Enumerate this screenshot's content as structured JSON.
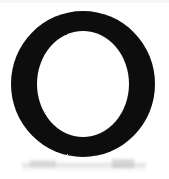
{
  "image": {
    "kind": "scanned-letterform",
    "character": "O",
    "description": "Uppercase letter O rendered as a solid black oval ring on a white background",
    "width": 169,
    "height": 179,
    "background_color": "#ffffff",
    "ink_color": "#0a0a0a",
    "smudge_color": "#c4c4c6"
  },
  "glyph": {
    "label": "O",
    "outer": {
      "center_x": 83,
      "center_y": 84,
      "radius_x": 72,
      "radius_y": 73
    },
    "counter": {
      "center_x": 83,
      "center_y": 84,
      "radius_x": 46,
      "radius_y": 53
    },
    "stroke_vertical_px": 26,
    "stroke_horizontal_px": 20
  },
  "artifacts": {
    "bottom_smudge_label": "faint gray scan smudge",
    "bottom_smudge_y": 161,
    "top_edge_label": "light scan edge"
  }
}
